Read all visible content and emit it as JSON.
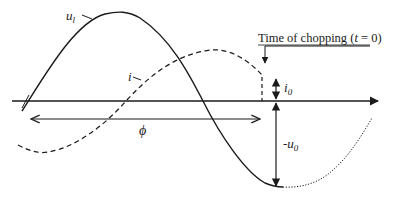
{
  "labels": {
    "voltage": "u",
    "voltage_sub": "l",
    "current": "i",
    "chopping": "Time of chopping (",
    "chopping_t": "t",
    "chopping_end": " = 0)",
    "i0": "i",
    "i0_sub": "0",
    "u0_prefix": "-u",
    "u0_sub": "0",
    "phi": "ϕ"
  },
  "colors": {
    "stroke": "#1a1a1a",
    "background": "#ffffff"
  },
  "curves": [
    {
      "name": "load-voltage-ul",
      "style": "solid",
      "description": "sinusoidal voltage, peak before chopping, decays to -u0 minimum"
    },
    {
      "name": "current-i",
      "style": "dashed",
      "description": "sinusoidal current lagging by phi, chopped at t=0 with value i0"
    },
    {
      "name": "voltage-continuation",
      "style": "dotted",
      "description": "voltage after chopping"
    }
  ]
}
